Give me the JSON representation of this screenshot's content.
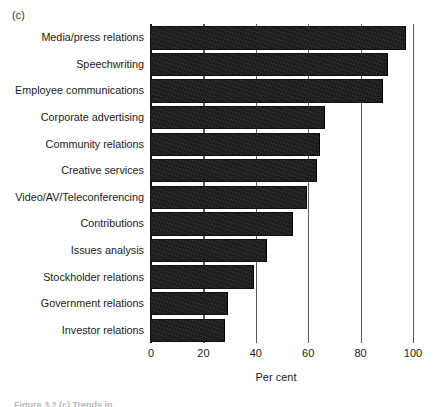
{
  "figure": {
    "panel_letter": "(c)",
    "caption_sliver": "Figure 3.2  (c) Trends in"
  },
  "chart_data": {
    "type": "bar",
    "orientation": "horizontal",
    "title": "",
    "subtitle": "",
    "xlabel": "Per cent",
    "ylabel": "",
    "xlim": [
      0,
      100
    ],
    "xticks": [
      0,
      20,
      40,
      60,
      80,
      100
    ],
    "xtick_labels": [
      "0",
      "20",
      "40",
      "60",
      "80",
      "100"
    ],
    "grid": "vertical tick lines at each x tick",
    "legend": "none",
    "bar_color": "#1c1a1a",
    "categories": [
      "Media/press relations",
      "Speechwriting",
      "Employee communications",
      "Corporate advertising",
      "Community relations",
      "Creative services",
      "Video/AV/Teleconferencing",
      "Contributions",
      "Issues analysis",
      "Stockholder relations",
      "Government relations",
      "Investor relations"
    ],
    "values": [
      97,
      90,
      88,
      66,
      64,
      63,
      59,
      54,
      44,
      39,
      29,
      28
    ]
  }
}
